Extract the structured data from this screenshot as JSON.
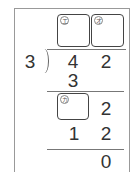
{
  "problem": {
    "type": "long-division",
    "divisor": "3",
    "dividend": [
      "4",
      "2"
    ],
    "quotient_boxes": [
      {
        "id": "e",
        "label": "エ"
      },
      {
        "id": "o",
        "label": "オ"
      }
    ],
    "steps": {
      "first_product": "3",
      "remainder_box": {
        "id": "ka",
        "label": "カ"
      },
      "brought_down": "2",
      "second_product": [
        "1",
        "2"
      ],
      "final_remainder": "0"
    }
  },
  "colors": {
    "frame": "#999999",
    "box_border": "#444444",
    "text": "#333333",
    "lines": "#777777"
  }
}
